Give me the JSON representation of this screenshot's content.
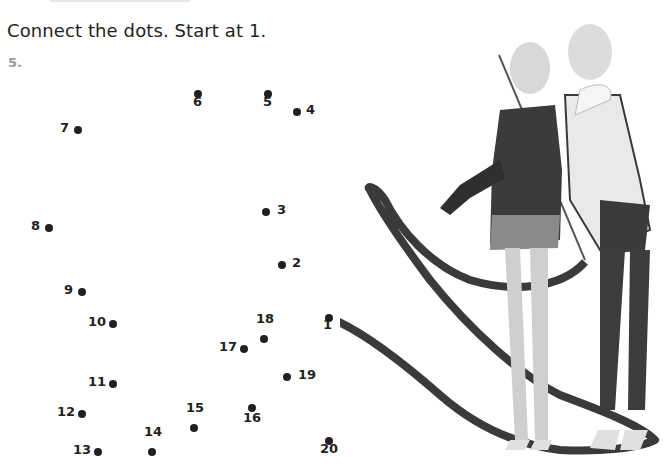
{
  "instruction": "Connect the dots. Start at 1.",
  "question_number": "5.",
  "dots": [
    {
      "n": "1",
      "x": 329,
      "y": 318,
      "lx": 323,
      "ly": 324
    },
    {
      "n": "2",
      "x": 282,
      "y": 265,
      "lx": 292,
      "ly": 262
    },
    {
      "n": "3",
      "x": 266,
      "y": 212,
      "lx": 277,
      "ly": 209
    },
    {
      "n": "4",
      "x": 297,
      "y": 112,
      "lx": 306,
      "ly": 109
    },
    {
      "n": "5",
      "x": 268,
      "y": 94,
      "lx": 263,
      "ly": 101
    },
    {
      "n": "6",
      "x": 198,
      "y": 94,
      "lx": 193,
      "ly": 101
    },
    {
      "n": "7",
      "x": 78,
      "y": 130,
      "lx": 60,
      "ly": 127
    },
    {
      "n": "8",
      "x": 49,
      "y": 228,
      "lx": 31,
      "ly": 225
    },
    {
      "n": "9",
      "x": 82,
      "y": 292,
      "lx": 64,
      "ly": 289
    },
    {
      "n": "10",
      "x": 113,
      "y": 324,
      "lx": 88,
      "ly": 321
    },
    {
      "n": "11",
      "x": 113,
      "y": 384,
      "lx": 88,
      "ly": 381
    },
    {
      "n": "12",
      "x": 82,
      "y": 414,
      "lx": 57,
      "ly": 411
    },
    {
      "n": "13",
      "x": 98,
      "y": 452,
      "lx": 73,
      "ly": 449
    },
    {
      "n": "14",
      "x": 152,
      "y": 452,
      "lx": 144,
      "ly": 431
    },
    {
      "n": "15",
      "x": 194,
      "y": 428,
      "lx": 186,
      "ly": 407
    },
    {
      "n": "16",
      "x": 252,
      "y": 408,
      "lx": 243,
      "ly": 417
    },
    {
      "n": "17",
      "x": 244,
      "y": 349,
      "lx": 219,
      "ly": 346
    },
    {
      "n": "18",
      "x": 264,
      "y": 339,
      "lx": 256,
      "ly": 318
    },
    {
      "n": "19",
      "x": 287,
      "y": 377,
      "lx": 298,
      "ly": 374
    },
    {
      "n": "20",
      "x": 329,
      "y": 441,
      "lx": 320,
      "ly": 448
    }
  ],
  "photo": {
    "description": "two young rhythmic gymnasts with ribbon"
  }
}
